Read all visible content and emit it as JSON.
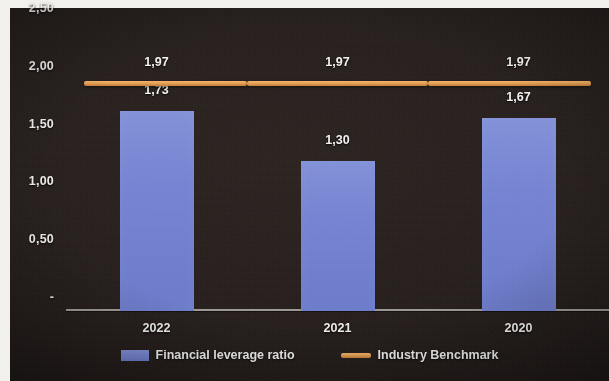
{
  "chart_data": {
    "type": "bar",
    "title": "",
    "subtitle": "",
    "xlabel": "",
    "ylabel": "",
    "categories": [
      "2022",
      "2021",
      "2020"
    ],
    "ylim": [
      0,
      2.5
    ],
    "ytick_labels": [
      "2,50",
      "2,00",
      "1,50",
      "1,00",
      "0,50",
      "-"
    ],
    "ytick_values": [
      2.5,
      2.0,
      1.5,
      1.0,
      0.5,
      0
    ],
    "grid": false,
    "legend_position": "bottom",
    "decimal_separator": ",",
    "series": [
      {
        "name": "Financial leverage ratio",
        "type": "bar",
        "color": "#7483d1",
        "values": [
          1.73,
          1.3,
          1.67
        ],
        "data_labels": [
          "1,73",
          "1,30",
          "1,67"
        ]
      },
      {
        "name": "Industry Benchmark",
        "type": "line",
        "color": "#e79f52",
        "values": [
          1.97,
          1.97,
          1.97
        ],
        "data_labels": [
          "1,97",
          "1,97",
          "1,97"
        ]
      }
    ]
  },
  "legend": {
    "items": [
      {
        "label": "Financial leverage ratio",
        "marker": "bar-swatch",
        "color": "#7483d1"
      },
      {
        "label": "Industry Benchmark",
        "marker": "line-swatch",
        "color": "#e79f52"
      }
    ]
  },
  "axis": {
    "y_labels": [
      "2,50",
      "2,00",
      "1,50",
      "1,00",
      "0,50",
      "-"
    ],
    "x_labels": [
      "2022",
      "2021",
      "2020"
    ]
  },
  "labels": {
    "bar_values": [
      "1,73",
      "1,30",
      "1,67"
    ],
    "benchmark_values": [
      "1,97",
      "1,97",
      "1,97"
    ]
  }
}
